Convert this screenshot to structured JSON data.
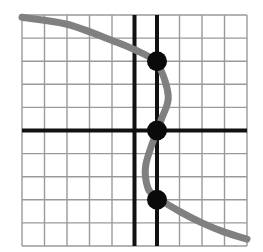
{
  "chart_data": {
    "type": "line",
    "title": "",
    "xlabel": "",
    "ylabel": "",
    "grid": true,
    "xlim": [
      -5,
      5
    ],
    "ylim": [
      -5,
      5
    ],
    "grid_cells": 10,
    "axes": {
      "x_axis_at_y": 0,
      "y_axis_at_x": 0
    },
    "vertical_line": {
      "x": 1,
      "label": "x = 1"
    },
    "curve": {
      "description": "S-shaped curve, not a function of x, crossing x=1 three times",
      "points": [
        [
          -5,
          4.9
        ],
        [
          -3,
          4.6
        ],
        [
          -1,
          3.9
        ],
        [
          0,
          3.5
        ],
        [
          1,
          2.9
        ],
        [
          1.5,
          1.5
        ],
        [
          1.2,
          0.5
        ],
        [
          1,
          0
        ],
        [
          0.5,
          -1.5
        ],
        [
          0.6,
          -2.5
        ],
        [
          1,
          -2.9
        ],
        [
          2,
          -3.5
        ],
        [
          3,
          -4.0
        ],
        [
          4,
          -4.4
        ],
        [
          5,
          -4.7
        ]
      ],
      "color": "#808080"
    },
    "intersection_points": [
      {
        "x": 1,
        "y": 3
      },
      {
        "x": 1,
        "y": 0
      },
      {
        "x": 1,
        "y": -3
      }
    ],
    "colors": {
      "grid": "#9a9a9a",
      "axes": "#111111",
      "curve": "#808080",
      "points": "#0a0a0a"
    }
  }
}
